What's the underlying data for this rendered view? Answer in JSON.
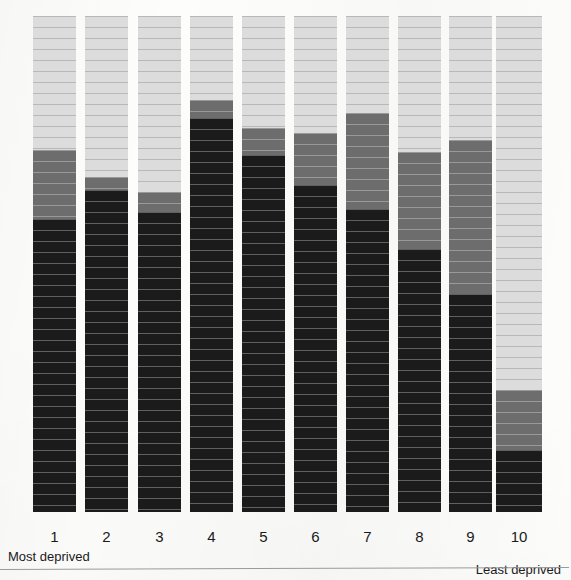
{
  "chart_data": {
    "type": "bar",
    "title": "",
    "subtitle": "",
    "xlabel": "",
    "ylabel": "",
    "stacked": true,
    "normalized": true,
    "grid": false,
    "legend_position": "none",
    "ylim": [
      0,
      100
    ],
    "categories": [
      "1",
      "2",
      "3",
      "4",
      "5",
      "6",
      "7",
      "8",
      "9",
      "10"
    ],
    "axis_annotations": {
      "left": "Most deprived",
      "right": "Least deprived"
    },
    "series": [
      {
        "name": "black-segment",
        "color": "#1b1b1b",
        "values": [
          59.0,
          65.0,
          60.5,
          79.5,
          72.0,
          66.0,
          61.0,
          53.0,
          44.0,
          12.5
        ]
      },
      {
        "name": "dark-grey-segment",
        "color": "#6d6d6d",
        "values": [
          14.0,
          2.5,
          4.0,
          3.5,
          5.5,
          10.5,
          19.5,
          19.5,
          31.0,
          12.0
        ]
      },
      {
        "name": "light-grey-segment",
        "color": "#dcdcdc",
        "values": [
          27.0,
          32.5,
          35.5,
          17.0,
          22.5,
          23.5,
          19.5,
          27.5,
          25.0,
          75.5
        ]
      }
    ]
  },
  "bars": [
    {
      "label": "1",
      "left": 33,
      "width": 43,
      "black": 59.0,
      "dark": 14.0,
      "light": 27.0
    },
    {
      "label": "2",
      "left": 85,
      "width": 43,
      "black": 65.0,
      "dark": 2.5,
      "light": 32.5
    },
    {
      "label": "3",
      "left": 138,
      "width": 43,
      "black": 60.5,
      "dark": 4.0,
      "light": 35.5
    },
    {
      "label": "4",
      "left": 190,
      "width": 43,
      "black": 79.5,
      "dark": 3.5,
      "light": 17.0
    },
    {
      "label": "5",
      "left": 242,
      "width": 43,
      "black": 72.0,
      "dark": 5.5,
      "light": 22.5
    },
    {
      "label": "6",
      "left": 294,
      "width": 43,
      "black": 66.0,
      "dark": 10.5,
      "light": 23.5
    },
    {
      "label": "7",
      "left": 346,
      "width": 43,
      "black": 61.0,
      "dark": 19.5,
      "light": 19.5
    },
    {
      "label": "8",
      "left": 398,
      "width": 43,
      "black": 53.0,
      "dark": 19.5,
      "light": 27.5
    },
    {
      "label": "9",
      "left": 449,
      "width": 43,
      "black": 44.0,
      "dark": 31.0,
      "light": 25.0
    },
    {
      "label": "10",
      "left": 496,
      "width": 46,
      "black": 12.5,
      "dark": 12.0,
      "light": 75.5
    }
  ],
  "colors": {
    "black": "#1b1b1b",
    "dark_grey": "#6d6d6d",
    "light_grey": "#dcdcdc",
    "background": "#fdfdfc",
    "text": "#1a1a1a",
    "rule": "#9a9a9a"
  }
}
